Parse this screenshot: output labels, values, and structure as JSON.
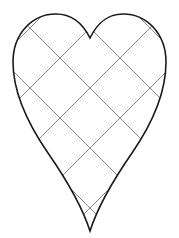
{
  "document": {
    "title": "Heart Grid Template",
    "background_color": "#ffffff",
    "width": 179,
    "height": 238,
    "description": "Line-art heart outline overlaid with a diagonal lattice grid"
  },
  "figure": {
    "name": "heart-with-diagonal-grid",
    "outline": {
      "label": "heart-outline",
      "stroke_color": "#1a1a1a",
      "stroke_width": 1.6,
      "fill": "none",
      "bounds": {
        "left": 13,
        "right": 166,
        "top": 14,
        "bottom": 231
      },
      "key_points": {
        "cleft_top": [
          90,
          38
        ],
        "bottom_tip": [
          90,
          231
        ],
        "left_extent": [
          13,
          78
        ],
        "right_extent": [
          166,
          78
        ],
        "left_lobe_apex": [
          52,
          15
        ],
        "right_lobe_apex": [
          128,
          15
        ]
      },
      "path": "M 90 38 C 84 26 74 14 56 14 C 32 14 13 34 13 62 C 13 92 28 124 48 153 C 66 179 82 206 90 231 C 98 206 114 179 132 153 C 152 124 166 92 166 62 C 166 34 147 14 123 14 C 105 14 96 26 90 38 Z"
    },
    "grid": {
      "label": "diagonal-lattice-grid",
      "stroke_color": "#8a8a8a",
      "stroke_width": 1.0,
      "angle_degrees": 45,
      "spacing": 42,
      "origin": [
        90,
        36
      ],
      "lines_down_right": [
        {
          "x1": -60,
          "y1": 58,
          "x2": 140,
          "y2": 258
        },
        {
          "x1": -30,
          "y1": 28,
          "x2": 170,
          "y2": 228
        },
        {
          "x1": 0,
          "y1": -2,
          "x2": 200,
          "y2": 198
        },
        {
          "x1": 30,
          "y1": -32,
          "x2": 230,
          "y2": 168
        },
        {
          "x1": 60,
          "y1": -62,
          "x2": 260,
          "y2": 138
        }
      ],
      "lines_down_left": [
        {
          "x1": 240,
          "y1": 58,
          "x2": 40,
          "y2": 258
        },
        {
          "x1": 210,
          "y1": 28,
          "x2": 10,
          "y2": 228
        },
        {
          "x1": 180,
          "y1": -2,
          "x2": -20,
          "y2": 198
        },
        {
          "x1": 150,
          "y1": -32,
          "x2": -50,
          "y2": 168
        },
        {
          "x1": 120,
          "y1": -62,
          "x2": -80,
          "y2": 138
        }
      ]
    }
  }
}
